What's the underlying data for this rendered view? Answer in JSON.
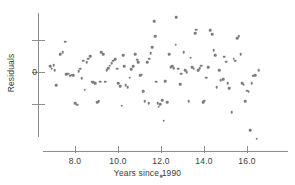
{
  "chart_data": {
    "type": "scatter",
    "title": "",
    "xlabel": "Years since 1990",
    "ylabel": "Residuals",
    "xlim": [
      6.6,
      17.0
    ],
    "ylim": [
      -3.6,
      2.6
    ],
    "xticks": [
      8.0,
      10.0,
      12.0,
      14.0,
      16.0
    ],
    "xtick_labels": [
      "8.0",
      "10.0",
      "12.0",
      "14.0",
      "16.0"
    ],
    "yticks": [
      1.0,
      0.0,
      -1.0
    ],
    "ytick_labels": [
      "",
      "0",
      ""
    ],
    "grid": false,
    "legend": null,
    "marker_color": "#7d7d7d",
    "axis_color": "#8d8d8d",
    "text_color": "#3b3b3b",
    "n_points": 126,
    "points": [
      [
        6.85,
        0.18
      ],
      [
        6.92,
        0.1
      ],
      [
        7.0,
        0.22
      ],
      [
        7.05,
        0.05
      ],
      [
        7.12,
        -0.42
      ],
      [
        7.3,
        0.55
      ],
      [
        7.42,
        0.62
      ],
      [
        7.55,
        0.95
      ],
      [
        7.6,
        -0.06
      ],
      [
        7.68,
        -0.05
      ],
      [
        7.78,
        -0.12
      ],
      [
        7.85,
        -0.08
      ],
      [
        7.92,
        -0.1
      ],
      [
        8.0,
        -0.98
      ],
      [
        8.1,
        -1.02
      ],
      [
        8.18,
        0.02
      ],
      [
        8.25,
        0.1
      ],
      [
        8.32,
        -0.2
      ],
      [
        8.45,
        -0.55
      ],
      [
        8.55,
        0.3
      ],
      [
        8.62,
        0.42
      ],
      [
        8.7,
        0.5
      ],
      [
        8.78,
        -0.3
      ],
      [
        8.85,
        -0.32
      ],
      [
        8.95,
        -0.35
      ],
      [
        9.02,
        -0.95
      ],
      [
        9.1,
        -0.92
      ],
      [
        9.22,
        0.62
      ],
      [
        9.3,
        0.55
      ],
      [
        9.4,
        -0.3
      ],
      [
        9.48,
        0.05
      ],
      [
        9.55,
        0.12
      ],
      [
        9.62,
        0.2
      ],
      [
        9.7,
        0.28
      ],
      [
        9.78,
        0.35
      ],
      [
        9.88,
        0.4
      ],
      [
        9.95,
        0.1
      ],
      [
        10.02,
        -0.35
      ],
      [
        10.1,
        -0.45
      ],
      [
        10.18,
        -1.05
      ],
      [
        10.25,
        0.52
      ],
      [
        10.35,
        -0.42
      ],
      [
        10.45,
        -0.48
      ],
      [
        10.55,
        -0.18
      ],
      [
        10.62,
        0.08
      ],
      [
        10.7,
        0.18
      ],
      [
        10.8,
        0.55
      ],
      [
        10.88,
        0.38
      ],
      [
        10.95,
        0.3
      ],
      [
        11.02,
        -0.1
      ],
      [
        11.1,
        -0.08
      ],
      [
        11.18,
        -0.6
      ],
      [
        11.25,
        -0.92
      ],
      [
        11.35,
        0.3
      ],
      [
        11.45,
        0.42
      ],
      [
        11.52,
        0.58
      ],
      [
        11.6,
        0.78
      ],
      [
        11.68,
        1.58
      ],
      [
        11.72,
        1.12
      ],
      [
        11.78,
        -0.3
      ],
      [
        11.85,
        -0.98
      ],
      [
        11.9,
        -1.08
      ],
      [
        11.95,
        -1.0
      ],
      [
        12.0,
        -3.25
      ],
      [
        12.05,
        -0.88
      ],
      [
        12.12,
        -1.52
      ],
      [
        12.2,
        -0.28
      ],
      [
        12.3,
        -0.95
      ],
      [
        12.38,
        0.55
      ],
      [
        12.45,
        0.15
      ],
      [
        12.52,
        0.18
      ],
      [
        12.6,
        0.12
      ],
      [
        12.68,
        0.85
      ],
      [
        12.72,
        1.72
      ],
      [
        12.8,
        0.1
      ],
      [
        12.88,
        -0.38
      ],
      [
        12.95,
        -0.05
      ],
      [
        13.05,
        0.62
      ],
      [
        13.12,
        0.05
      ],
      [
        13.2,
        0.0
      ],
      [
        13.28,
        -0.92
      ],
      [
        13.38,
        0.45
      ],
      [
        13.45,
        0.15
      ],
      [
        13.52,
        0.1
      ],
      [
        13.58,
        1.22
      ],
      [
        13.65,
        1.32
      ],
      [
        13.72,
        0.05
      ],
      [
        13.8,
        0.12
      ],
      [
        13.88,
        0.2
      ],
      [
        13.95,
        -0.95
      ],
      [
        14.02,
        -0.9
      ],
      [
        14.1,
        -0.18
      ],
      [
        14.2,
        0.15
      ],
      [
        14.3,
        1.3
      ],
      [
        14.38,
        1.18
      ],
      [
        14.45,
        0.68
      ],
      [
        14.52,
        0.52
      ],
      [
        14.6,
        -0.48
      ],
      [
        14.7,
        0.05
      ],
      [
        14.78,
        -0.25
      ],
      [
        14.88,
        -0.22
      ],
      [
        14.95,
        0.48
      ],
      [
        15.02,
        0.32
      ],
      [
        15.1,
        -0.35
      ],
      [
        15.18,
        -0.5
      ],
      [
        15.28,
        -1.25
      ],
      [
        15.38,
        0.42
      ],
      [
        15.45,
        0.35
      ],
      [
        15.55,
        1.05
      ],
      [
        15.62,
        1.12
      ],
      [
        15.7,
        0.55
      ],
      [
        15.78,
        -0.35
      ],
      [
        15.85,
        -0.4
      ],
      [
        15.92,
        -0.92
      ],
      [
        16.0,
        -0.58
      ],
      [
        16.08,
        -0.62
      ],
      [
        16.15,
        -1.82
      ],
      [
        16.22,
        -0.35
      ],
      [
        16.3,
        -0.12
      ],
      [
        16.38,
        -0.1
      ],
      [
        16.45,
        -2.08
      ],
      [
        16.55,
        0.05
      ],
      [
        11.42,
        -0.98
      ],
      [
        10.3,
        0.18
      ],
      [
        9.18,
        -0.3
      ],
      [
        8.38,
        0.35
      ]
    ]
  },
  "axis": {
    "x_title": "Years since 1990",
    "y_title": "Residuals",
    "x_tick_labels": [
      "8.0",
      "10.0",
      "12.0",
      "14.0",
      "16.0"
    ],
    "y_zero_label": "0"
  }
}
